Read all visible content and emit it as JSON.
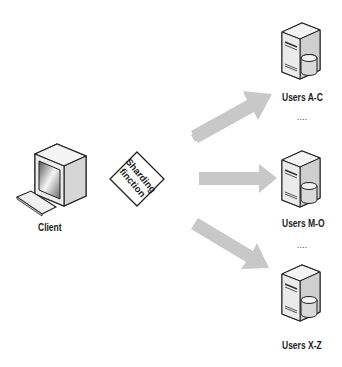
{
  "diagram": {
    "client": {
      "label": "Client",
      "icon": "desktop-computer-icon"
    },
    "sharding": {
      "line1": "Sharding",
      "line2": "finction",
      "shape": "diamond"
    },
    "arrows": [
      {
        "direction": "up-right",
        "target": "Users A-C",
        "color": "#c8c8c8"
      },
      {
        "direction": "right",
        "target": "Users M-O",
        "color": "#c8c8c8"
      },
      {
        "direction": "down-right",
        "target": "Users X-Z",
        "color": "#c8c8c8"
      }
    ],
    "servers": [
      {
        "label": "Users A-C",
        "icon": "server-database-icon"
      },
      {
        "label": "Users M-O",
        "icon": "server-database-icon"
      },
      {
        "label": "Users X-Z",
        "icon": "server-database-icon"
      }
    ],
    "ellipses": [
      "....",
      "...."
    ]
  }
}
